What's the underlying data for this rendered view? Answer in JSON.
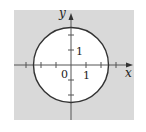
{
  "diagram": {
    "type": "circle-region-plot",
    "equation_region": "x^2 + y^2 >= r^2 (shaded outside circle)",
    "circle": {
      "center": [
        0,
        0
      ],
      "radius": 2.5
    },
    "shading": {
      "region": "outside",
      "color": "#d9d9d9"
    },
    "axes": {
      "x_label": "x",
      "y_label": "y",
      "origin_label": "0",
      "x_tick_label": "1",
      "y_tick_label": "1",
      "x_ticks": [
        -3,
        -2,
        -1,
        1,
        2,
        3
      ],
      "y_ticks": [
        -2,
        -1,
        1,
        2
      ]
    },
    "colors": {
      "stroke": "#333333",
      "axis": "#555555",
      "background": "#ffffff"
    }
  }
}
